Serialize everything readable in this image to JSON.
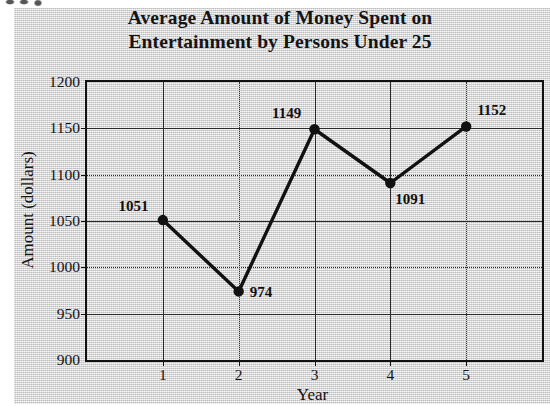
{
  "chart_data": {
    "type": "line",
    "title": "Average Amount of Money Spent on Entertainment by Persons Under 25",
    "title_line1": "Average Amount of Money Spent on",
    "title_line2": "Entertainment by Persons Under 25",
    "xlabel": "Year",
    "ylabel": "Amount (dollars)",
    "categories": [
      "1",
      "2",
      "3",
      "4",
      "5"
    ],
    "values": [
      1051,
      974,
      1149,
      1091,
      1152
    ],
    "point_labels": [
      "1051",
      "974",
      "1149",
      "1091",
      "1152"
    ],
    "ylim": [
      900,
      1200
    ],
    "yticks": [
      1200,
      1150,
      1100,
      1050,
      1000,
      950,
      900
    ],
    "ytick_labels": [
      "1200",
      "1150",
      "1100",
      "1050",
      "1000",
      "950",
      "900"
    ],
    "xticks": [
      "1",
      "2",
      "3",
      "4",
      "5"
    ],
    "grid": true,
    "grid_style_horizontal": [
      "solid",
      "dotted",
      "solid",
      "dotted",
      "solid",
      "solid"
    ],
    "grid_style_vertical": [
      "solid",
      "dotted",
      "solid",
      "solid",
      "dotted"
    ],
    "legend": null,
    "legend_position": "none",
    "line_color": "#111111",
    "marker": "circle",
    "marker_color": "#111111",
    "background_color": "#d8d8d8",
    "axis_color": "#111111",
    "label_placement": [
      "left",
      "right",
      "left-above",
      "below-right",
      "right-above"
    ]
  }
}
